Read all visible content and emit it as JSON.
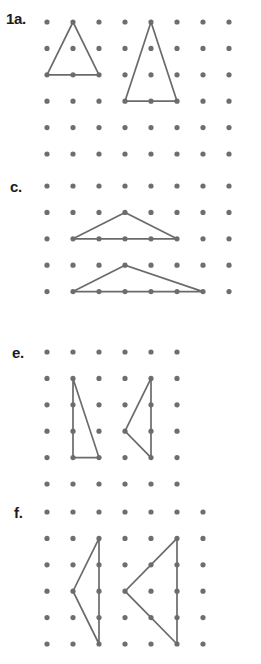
{
  "page": {
    "background_color": "#ffffff",
    "dot_color": "#6e6e6e",
    "line_color": "#6b6b6b",
    "label_color": "#1b1b1b",
    "width": 261,
    "height": 664
  },
  "grid": {
    "dot_radius": 2.6,
    "col_spacing": 26,
    "row_spacing": 26.4
  },
  "sections": [
    {
      "id": "section-1a",
      "label": "1a.",
      "label_x": 6,
      "label_y": 18,
      "origin_x": 47,
      "origin_y": 22,
      "cols": 8,
      "rows": 6,
      "shapes": [
        {
          "name": "triangle-1a-left",
          "type": "triangle",
          "points": "1,0 0,2 2,2",
          "description": "isosceles triangle, apex at column 2 row 1, base from column 1 to column 3 on row 3"
        },
        {
          "name": "triangle-1a-right",
          "type": "triangle",
          "points": "4,0 3,3 5,3",
          "description": "tall isosceles triangle, apex at column 5 row 1, base from column 4 to column 6 on row 4"
        }
      ]
    },
    {
      "id": "section-c",
      "label": "c.",
      "label_x": 10,
      "label_y": 186,
      "origin_x": 47,
      "origin_y": 186,
      "cols": 8,
      "rows": 5,
      "shapes": [
        {
          "name": "triangle-c-upper",
          "type": "triangle",
          "points": "3,1 1,2 5,2",
          "description": "triangle with apex at column 4 row 2, base from column 2 to column 6 on row 3"
        },
        {
          "name": "triangle-c-lower",
          "type": "triangle",
          "points": "3,3 1,4 6,4",
          "description": "scalene triangle with apex at column 4 row 4, base from column 2 to column 7 on row 5"
        }
      ]
    },
    {
      "id": "section-e",
      "label": "e.",
      "label_x": 12,
      "label_y": 352,
      "origin_x": 47,
      "origin_y": 352,
      "cols": 6,
      "rows": 6,
      "shapes": [
        {
          "name": "triangle-e-left",
          "type": "triangle",
          "points": "1,1 1,4 2,4",
          "description": "right triangle, vertical leg at column 2 from row 2 to row 5, base to column 3"
        },
        {
          "name": "triangle-e-right",
          "type": "triangle",
          "points": "4,1 4,4 3,3",
          "description": "triangle, vertical leg at column 5 from row 2 to row 5, apex pointing left at column 4 row 4"
        }
      ]
    },
    {
      "id": "section-f",
      "label": "f.",
      "label_x": 14,
      "label_y": 512,
      "origin_x": 47,
      "origin_y": 512,
      "cols": 7,
      "rows": 6,
      "shapes": [
        {
          "name": "triangle-f-left",
          "type": "triangle",
          "points": "2,1 2,5 1,3",
          "description": "triangle, vertical leg at column 3 from row 2 to row 6, apex pointing left at column 2 row 4"
        },
        {
          "name": "triangle-f-right",
          "type": "triangle",
          "points": "5,1 5,5 3,3",
          "description": "larger triangle, vertical leg at column 6 from row 2 to row 6, apex pointing left at column 4 row 4"
        }
      ]
    }
  ]
}
